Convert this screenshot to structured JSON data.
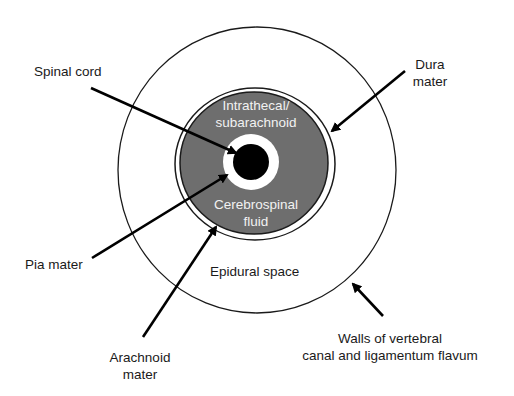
{
  "diagram": {
    "type": "anatomical-cross-section",
    "colors": {
      "background": "#ffffff",
      "csf_space": "#6e6e6e",
      "spinal_cord": "#000000",
      "outline": "#1a1a1a",
      "inner_text": "#f2f2f2"
    },
    "regions": {
      "intrathecal": [
        "Intrathecal/",
        "subarachnoid"
      ],
      "csf": [
        "Cerebrospinal",
        "fluid"
      ],
      "epidural": "Epidural space"
    },
    "labels": {
      "spinal_cord": "Spinal cord",
      "dura": [
        "Dura",
        "mater"
      ],
      "pia": "Pia mater",
      "arachnoid": [
        "Arachnoid",
        "mater"
      ],
      "walls": [
        "Walls of vertebral",
        "canal and ligamentum flavum"
      ]
    }
  }
}
